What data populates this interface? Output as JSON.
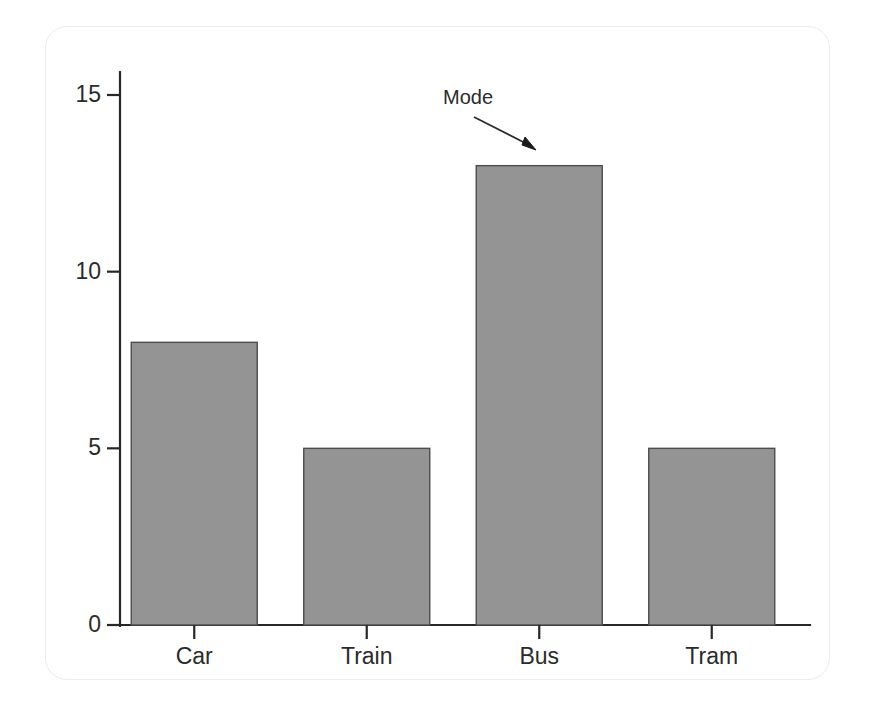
{
  "chart_data": {
    "type": "bar",
    "title": "",
    "subtitle": "",
    "xlabel": "",
    "ylabel": "",
    "categories": [
      "Car",
      "Train",
      "Bus",
      "Tram"
    ],
    "values": [
      8,
      5,
      13,
      5
    ],
    "series": [
      {
        "name": "Frequency",
        "values": [
          8,
          5,
          13,
          5
        ]
      }
    ],
    "ylim": [
      0,
      15.5
    ],
    "yticks": [
      0,
      5,
      10,
      15
    ],
    "ytick_labels": [
      "0",
      "5",
      "10",
      "15"
    ],
    "xtick_labels": [
      "Car",
      "Train",
      "Bus",
      "Tram"
    ],
    "grid": false,
    "legend": null,
    "legend_position": "none",
    "bar_color": "#949494",
    "bar_edge_color": "#4c4c4c",
    "axis_color": "#272727",
    "text_color": "#2b2b2b",
    "annotations": [
      {
        "text": "Mode",
        "target_category": "Bus",
        "target_value": 13,
        "arrow": true
      }
    ]
  },
  "figure": {
    "background_color": "#ffffff",
    "card_border_color": "#ececec"
  }
}
